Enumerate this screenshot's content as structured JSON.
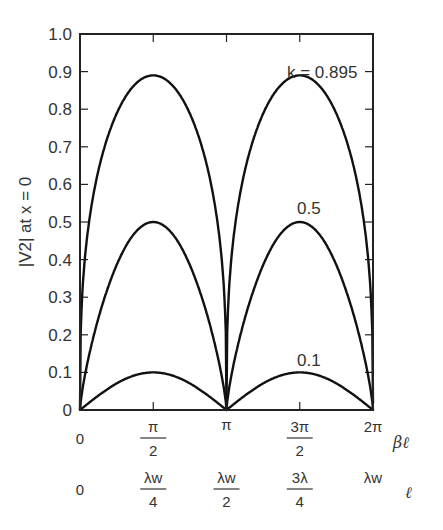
{
  "chart_data": {
    "type": "line",
    "title": "",
    "ylabel": "|V2| at x = 0",
    "xlabel": "βℓ",
    "xlabel_secondary": "ℓ",
    "ylim": [
      0,
      1.0
    ],
    "xlim": [
      0,
      6.2832
    ],
    "yticks": [
      "0",
      "0.1",
      "0.2",
      "0.3",
      "0.4",
      "0.5",
      "0.6",
      "0.7",
      "0.8",
      "0.9",
      "1.0"
    ],
    "xticks_primary": [
      {
        "num": "0",
        "den": ""
      },
      {
        "num": "π",
        "den": "2"
      },
      {
        "num": "π",
        "den": ""
      },
      {
        "num": "3π",
        "den": "2"
      },
      {
        "num": "2π",
        "den": ""
      }
    ],
    "xticks_secondary": [
      {
        "num": "0",
        "den": ""
      },
      {
        "num": "λw",
        "den": "4"
      },
      {
        "num": "λw",
        "den": "2"
      },
      {
        "num": "3λ",
        "den": "4"
      },
      {
        "num": "λw",
        "den": ""
      }
    ],
    "grid": false,
    "series": [
      {
        "name": "k = 0.895",
        "label": "k = 0.895",
        "peak": 0.89,
        "x": [
          0,
          0.785,
          1.571,
          2.356,
          3.142,
          3.927,
          4.712,
          5.498,
          6.283
        ],
        "values": [
          0,
          0.8,
          0.89,
          0.8,
          0,
          0.8,
          0.89,
          0.8,
          0
        ]
      },
      {
        "name": "k = 0.5",
        "label": "0.5",
        "peak": 0.5,
        "x": [
          0,
          0.785,
          1.571,
          2.356,
          3.142,
          3.927,
          4.712,
          5.498,
          6.283
        ],
        "values": [
          0,
          0.39,
          0.5,
          0.39,
          0,
          0.39,
          0.5,
          0.39,
          0
        ]
      },
      {
        "name": "k = 0.1",
        "label": "0.1",
        "peak": 0.1,
        "x": [
          0,
          0.785,
          1.571,
          2.356,
          3.142,
          3.927,
          4.712,
          5.498,
          6.283
        ],
        "values": [
          0,
          0.07,
          0.1,
          0.07,
          0,
          0.07,
          0.1,
          0.07,
          0
        ]
      }
    ]
  }
}
